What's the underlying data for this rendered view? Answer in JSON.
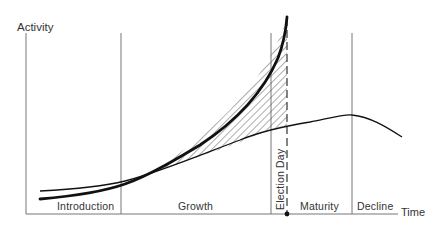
{
  "diagram": {
    "y_axis_label": "Activity",
    "x_axis_label": "Time",
    "phases": [
      {
        "label": "Introduction"
      },
      {
        "label": "Growth"
      },
      {
        "label": "Maturity"
      },
      {
        "label": "Decline"
      }
    ],
    "event_marker": {
      "label": "Election Day"
    },
    "curves": [
      {
        "name": "campaign-activity-curve",
        "style": "thick"
      },
      {
        "name": "product-life-cycle-curve",
        "style": "thin"
      }
    ],
    "shaded_region": {
      "pattern": "diagonal-hatch",
      "between": [
        "campaign-activity-curve",
        "product-life-cycle-curve"
      ]
    },
    "colors": {
      "line": "#111111",
      "divider": "#777777",
      "text": "#333333",
      "background": "#ffffff"
    }
  }
}
